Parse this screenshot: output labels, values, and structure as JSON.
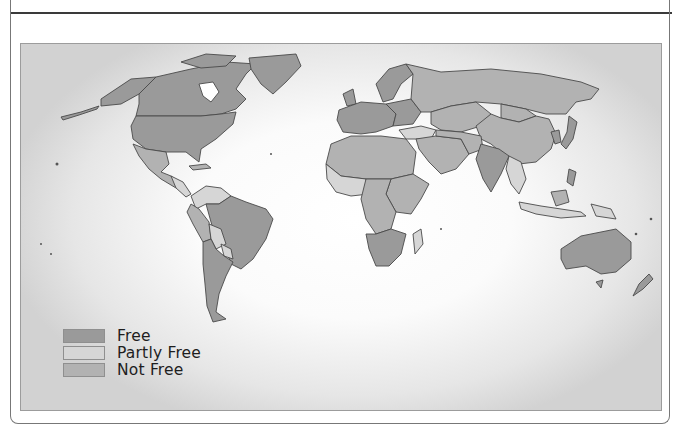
{
  "map": {
    "type": "choropleth",
    "subject": "world countries by freedom status",
    "colors": {
      "free": "#9a9a9a",
      "partly_free": "#d6d6d6",
      "not_free": "#b2b2b2",
      "border": "#4a4a4a",
      "water": "#ffffff"
    }
  },
  "legend": {
    "items": [
      {
        "key": "free",
        "label": "Free",
        "color": "#9a9a9a"
      },
      {
        "key": "partly_free",
        "label": "Partly Free",
        "color": "#d6d6d6"
      },
      {
        "key": "not_free",
        "label": "Not Free",
        "color": "#b2b2b2"
      }
    ]
  }
}
